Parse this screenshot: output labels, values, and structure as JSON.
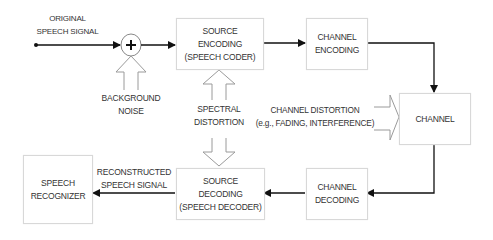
{
  "diagram": {
    "inputs": {
      "original_signal": "ORIGINAL\nSPEECH SIGNAL",
      "adder_symbol": "+",
      "background_noise": "BACKGROUND\nNOISE",
      "spectral_distortion": "SPECTRAL\nDISTORTION",
      "channel_distortion": "CHANNEL DISTORTION\n(e.g., FADING, INTERFERENCE)",
      "reconstructed_signal": "RECONSTRUCTED\nSPEECH SIGNAL"
    },
    "blocks": {
      "source_encoding": "SOURCE\nENCODING\n(SPEECH CODER)",
      "channel_encoding": "CHANNEL\nENCODING",
      "channel": "CHANNEL",
      "channel_decoding": "CHANNEL\nDECODING",
      "source_decoding": "SOURCE\nDECODING\n(SPEECH DECODER)",
      "speech_recognizer": "SPEECH\nRECOGNIZER"
    },
    "edges": [
      {
        "from": "original_signal",
        "to": "adder"
      },
      {
        "from": "background_noise",
        "to": "adder",
        "style": "hollow-arrow"
      },
      {
        "from": "adder",
        "to": "source_encoding"
      },
      {
        "from": "spectral_distortion",
        "to": "source_encoding",
        "style": "hollow-arrow"
      },
      {
        "from": "spectral_distortion",
        "to": "source_decoding",
        "style": "hollow-arrow"
      },
      {
        "from": "source_encoding",
        "to": "channel_encoding"
      },
      {
        "from": "channel_encoding",
        "to": "channel"
      },
      {
        "from": "channel_distortion",
        "to": "channel",
        "style": "hollow-arrow"
      },
      {
        "from": "channel",
        "to": "channel_decoding"
      },
      {
        "from": "channel_decoding",
        "to": "source_decoding"
      },
      {
        "from": "source_decoding",
        "to": "speech_recognizer"
      }
    ],
    "colors": {
      "line": "#111111",
      "hollow_arrow": "#9a9a9a",
      "box_border": "#d8d8d8",
      "text": "#333333"
    }
  }
}
